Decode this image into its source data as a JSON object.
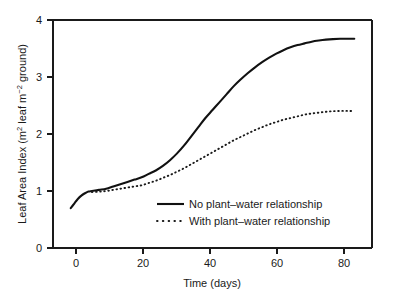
{
  "chart_data": {
    "type": "line",
    "title": "",
    "xlabel": "Time (days)",
    "ylabel": "Leaf Area Index (m2 leaf m-2 ground)",
    "ylabel_parts": {
      "lead": "Leaf Area Index (m",
      "sup1": "2",
      "mid": " leaf m",
      "sup2": "−2",
      "tail": " ground)"
    },
    "xlim": [
      -5,
      85
    ],
    "ylim": [
      0,
      4
    ],
    "grid": false,
    "legend_position": "inside-lower-center",
    "xticks": [
      0,
      20,
      40,
      60,
      80
    ],
    "xtick_labels": [
      "0",
      "20",
      "40",
      "60",
      "80"
    ],
    "yticks": [
      0,
      1,
      2,
      3,
      4
    ],
    "ytick_labels": [
      "0",
      "1",
      "2",
      "3",
      "4"
    ],
    "x": [
      0,
      1,
      2,
      3,
      4,
      5,
      6,
      8,
      10,
      12,
      14,
      16,
      18,
      20,
      22,
      24,
      26,
      28,
      30,
      32,
      34,
      36,
      38,
      40,
      42,
      44,
      46,
      48,
      50,
      52,
      54,
      56,
      58,
      60,
      62,
      64,
      66,
      68,
      70,
      72,
      74,
      76,
      78,
      80
    ],
    "series": [
      {
        "name": "No plant–water relationship",
        "style": "solid",
        "color": "#111111",
        "values": [
          0.7,
          0.78,
          0.86,
          0.92,
          0.96,
          0.99,
          1.0,
          1.02,
          1.04,
          1.08,
          1.12,
          1.16,
          1.2,
          1.24,
          1.3,
          1.36,
          1.44,
          1.54,
          1.66,
          1.8,
          1.96,
          2.12,
          2.28,
          2.42,
          2.56,
          2.7,
          2.84,
          2.96,
          3.07,
          3.17,
          3.26,
          3.34,
          3.41,
          3.47,
          3.52,
          3.56,
          3.59,
          3.62,
          3.64,
          3.655,
          3.665,
          3.67,
          3.67,
          3.67
        ]
      },
      {
        "name": "With plant–water relationship",
        "style": "dotted",
        "color": "#1a1a1a",
        "values": [
          null,
          null,
          null,
          null,
          null,
          null,
          0.98,
          0.99,
          1.0,
          1.02,
          1.04,
          1.06,
          1.08,
          1.1,
          1.14,
          1.18,
          1.23,
          1.28,
          1.34,
          1.4,
          1.47,
          1.54,
          1.61,
          1.68,
          1.75,
          1.82,
          1.89,
          1.95,
          2.01,
          2.07,
          2.12,
          2.17,
          2.21,
          2.25,
          2.28,
          2.31,
          2.34,
          2.36,
          2.375,
          2.39,
          2.4,
          2.405,
          2.405,
          2.4
        ]
      }
    ],
    "annotations": []
  },
  "legend": {
    "items": [
      {
        "label": "No plant–water relationship",
        "style": "solid"
      },
      {
        "label": "With plant–water relationship",
        "style": "dotted"
      }
    ]
  },
  "colors": {
    "background": "#ffffff",
    "axis": "#1a1a1a",
    "series_solid": "#111111",
    "series_dotted": "#1a1a1a"
  }
}
